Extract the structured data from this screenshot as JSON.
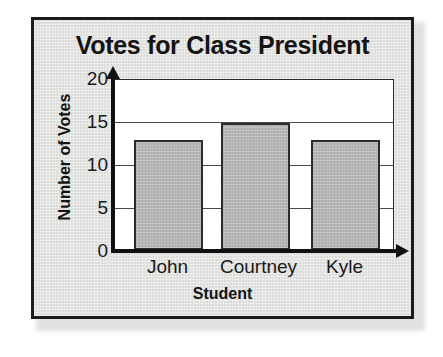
{
  "chart_data": {
    "type": "bar",
    "title": "Votes for Class President",
    "xlabel": "Student",
    "ylabel": "Number of Votes",
    "categories": [
      "John",
      "Courtney",
      "Kyle"
    ],
    "values": [
      13,
      15,
      13
    ],
    "ylim": [
      0,
      20
    ],
    "yticks": [
      0,
      5,
      10,
      15,
      20
    ],
    "ytick_labels": [
      "0",
      "5",
      "10",
      "15",
      "20"
    ],
    "grid": "horizontal",
    "legend": "none",
    "colors": {
      "bar_fill": "#b5b5b3",
      "bar_stroke": "#2b2b2b",
      "plot_background": "#ffffff",
      "figure_background": "#dcdcda",
      "frame_border": "#1b1b1b",
      "text": "#141414",
      "gridline": "#4a4a4a",
      "axis": "#101010"
    }
  }
}
